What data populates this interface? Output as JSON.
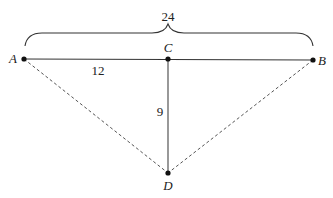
{
  "diagram": {
    "points": {
      "A": {
        "label": "A",
        "x": 24,
        "y": 59
      },
      "B": {
        "label": "B",
        "x": 313,
        "y": 60
      },
      "C": {
        "label": "C",
        "x": 168,
        "y": 59
      },
      "D": {
        "label": "D",
        "x": 168,
        "y": 173
      }
    },
    "measures": {
      "AB": "24",
      "AC": "12",
      "CD": "9"
    },
    "colors": {
      "line": "#333333",
      "dashed": "#555555",
      "text": "#222222"
    }
  }
}
